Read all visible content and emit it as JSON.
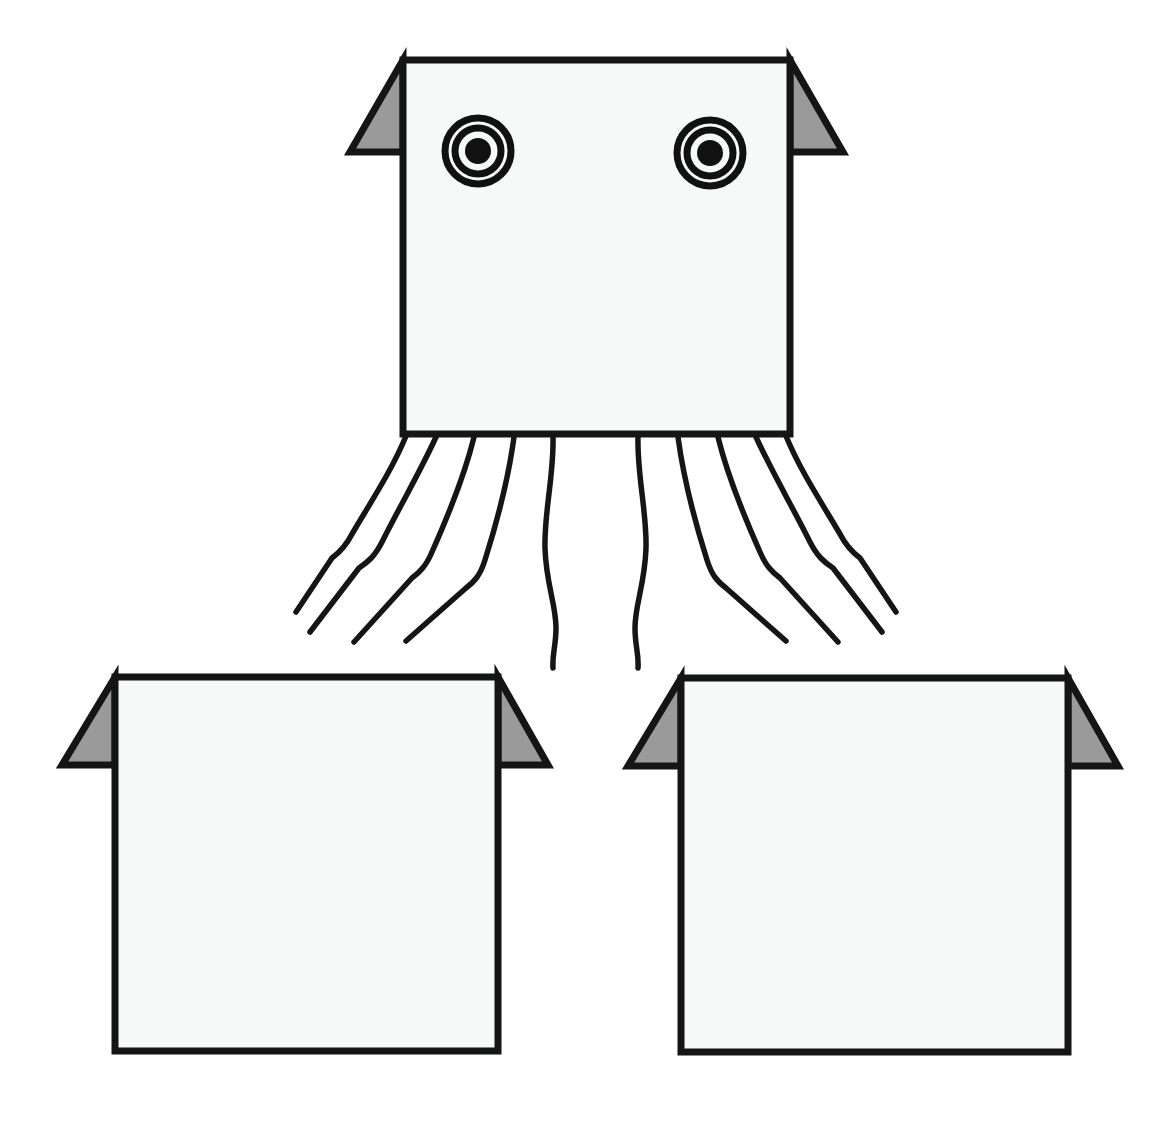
{
  "illustration": {
    "title": "Squid figure with two blank body templates",
    "background_color": "#ffffff",
    "body_fill_color": "#f7f8f8",
    "fin_fill_color": "#9a9a9a",
    "outline_color": "#151515",
    "eye_color": "#111111"
  },
  "figures": [
    {
      "id": "main-squid",
      "label": "Squid with eyes and tentacles",
      "body": {
        "x": 403,
        "y": 60,
        "width": 387,
        "height": 374
      },
      "left_fin": {
        "apex_x": 403,
        "apex_y": 60,
        "tip_x": 350,
        "tip_y": 152,
        "base_x": 403,
        "base_y": 152
      },
      "right_fin": {
        "apex_x": 790,
        "apex_y": 60,
        "tip_x": 843,
        "tip_y": 152,
        "base_x": 790,
        "base_y": 152
      },
      "eyes": [
        {
          "id": "left-eye",
          "cx": 478,
          "cy": 151,
          "outer_r": 33,
          "mid_r": 23,
          "pupil_r": 13
        },
        {
          "id": "right-eye",
          "cx": 710,
          "cy": 153,
          "outer_r": 33,
          "mid_r": 23,
          "pupil_r": 13
        }
      ],
      "tentacle_count": 10
    },
    {
      "id": "template-box-left",
      "label": "Blank body template left",
      "body": {
        "x": 115,
        "y": 677,
        "width": 383,
        "height": 374
      },
      "left_fin": {
        "apex_x": 115,
        "apex_y": 677,
        "tip_x": 62,
        "tip_y": 765,
        "base_x": 115,
        "base_y": 765
      },
      "right_fin": {
        "apex_x": 498,
        "apex_y": 677,
        "tip_x": 548,
        "tip_y": 765,
        "base_x": 498,
        "base_y": 765
      },
      "eyes": [],
      "tentacle_count": 0
    },
    {
      "id": "template-box-right",
      "label": "Blank body template right",
      "body": {
        "x": 681,
        "y": 678,
        "width": 387,
        "height": 374
      },
      "left_fin": {
        "apex_x": 681,
        "apex_y": 678,
        "tip_x": 628,
        "tip_y": 766,
        "base_x": 681,
        "base_y": 766
      },
      "right_fin": {
        "apex_x": 1068,
        "apex_y": 678,
        "tip_x": 1118,
        "tip_y": 766,
        "base_x": 1068,
        "base_y": 766
      },
      "eyes": [],
      "tentacle_count": 0
    }
  ],
  "tentacles": [
    {
      "id": "tentacle-1",
      "side": "left",
      "path": "M 406 436 C 392 470, 372 500, 352 534 C 346 546, 340 552, 332 558 L 296 612"
    },
    {
      "id": "tentacle-2",
      "side": "left",
      "path": "M 436 437 C 420 472, 400 506, 382 542 C 375 556, 368 562, 359 568 L 310 632"
    },
    {
      "id": "tentacle-3",
      "side": "left",
      "path": "M 474 437 C 464 478, 448 516, 432 552 C 426 566, 420 572, 412 578 L 354 642"
    },
    {
      "id": "tentacle-4",
      "side": "left",
      "path": "M 514 437 C 508 482, 497 522, 485 560 C 480 576, 474 582, 466 588 L 406 641"
    },
    {
      "id": "tentacle-5",
      "side": "left",
      "path": "M 553 437 C 554 476, 544 512, 545 548 C 546 584, 556 604, 556 628 C 556 646, 552 654, 553 668"
    },
    {
      "id": "tentacle-6",
      "side": "right",
      "path": "M 638 437 C 637 476, 647 512, 646 548 C 645 584, 635 604, 635 628 C 635 646, 639 654, 638 668"
    },
    {
      "id": "tentacle-7",
      "side": "right",
      "path": "M 678 437 C 684 482, 695 522, 707 560 C 712 576, 718 582, 726 588 L 786 641"
    },
    {
      "id": "tentacle-8",
      "side": "right",
      "path": "M 718 437 C 728 478, 744 516, 760 552 C 766 566, 772 572, 780 578 L 838 642"
    },
    {
      "id": "tentacle-9",
      "side": "right",
      "path": "M 756 437 C 772 472, 792 506, 810 542 C 817 556, 824 562, 833 568 L 882 632"
    },
    {
      "id": "tentacle-10",
      "side": "right",
      "path": "M 786 436 C 800 470, 820 500, 840 534 C 846 546, 852 552, 860 558 L 896 612"
    }
  ]
}
